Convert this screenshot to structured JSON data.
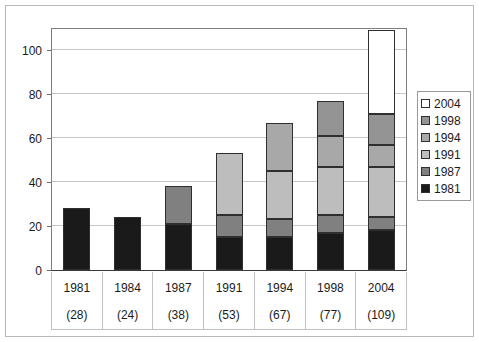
{
  "chart_data": {
    "type": "bar",
    "subtype": "stacked-bar",
    "title": "",
    "xlabel": "",
    "ylabel": "",
    "ylim": [
      0,
      110
    ],
    "yticks": [
      0,
      20,
      40,
      60,
      80,
      100
    ],
    "ytick_labels": [
      "0",
      "20",
      "40",
      "60",
      "80",
      "100"
    ],
    "grid": true,
    "grid_axis": "y",
    "legend_position": "right",
    "categories": [
      "1981",
      "1984",
      "1987",
      "1991",
      "1994",
      "1998",
      "2004"
    ],
    "category_totals": [
      28,
      24,
      38,
      53,
      67,
      77,
      109
    ],
    "category_total_labels": [
      "(28)",
      "(24)",
      "(38)",
      "(53)",
      "(67)",
      "(77)",
      "(109)"
    ],
    "series": [
      {
        "name": "1981",
        "color": "#1a1a1a",
        "values": [
          28,
          24,
          21,
          15,
          15,
          17,
          18
        ]
      },
      {
        "name": "1987",
        "color": "#808080",
        "values": [
          0,
          0,
          17,
          10,
          8,
          8,
          6
        ]
      },
      {
        "name": "1991",
        "color": "#bdbdbd",
        "values": [
          0,
          0,
          0,
          28,
          22,
          22,
          23
        ]
      },
      {
        "name": "1994",
        "color": "#a8a8a8",
        "values": [
          0,
          0,
          0,
          0,
          22,
          14,
          10
        ]
      },
      {
        "name": "1998",
        "color": "#949494",
        "values": [
          0,
          0,
          0,
          0,
          0,
          16,
          14
        ]
      },
      {
        "name": "2004",
        "color": "#ffffff",
        "values": [
          0,
          0,
          0,
          0,
          0,
          0,
          38
        ]
      }
    ],
    "stack_order_bottom_to_top": [
      "1981",
      "1987",
      "1991",
      "1994",
      "1998",
      "2004"
    ]
  },
  "legend": {
    "items": [
      {
        "label": "2004",
        "color": "#ffffff"
      },
      {
        "label": "1998",
        "color": "#949494"
      },
      {
        "label": "1994",
        "color": "#a8a8a8"
      },
      {
        "label": "1991",
        "color": "#bdbdbd"
      },
      {
        "label": "1987",
        "color": "#808080"
      },
      {
        "label": "1981",
        "color": "#1a1a1a"
      }
    ]
  },
  "axis": {
    "y_tick_labels": [
      "100",
      "80",
      "60",
      "40",
      "20",
      "0"
    ],
    "y_tick_values": [
      100,
      80,
      60,
      40,
      20,
      0
    ]
  },
  "xaxis_table": {
    "rows": [
      {
        "year": "1981",
        "total": "(28)"
      },
      {
        "year": "1984",
        "total": "(24)"
      },
      {
        "year": "1987",
        "total": "(38)"
      },
      {
        "year": "1991",
        "total": "(53)"
      },
      {
        "year": "1994",
        "total": "(67)"
      },
      {
        "year": "1998",
        "total": "(77)"
      },
      {
        "year": "2004",
        "total": "(109)"
      }
    ]
  },
  "colors": {
    "plot_border": "#7d7d7d",
    "axis_line": "#3a3a3a",
    "gridline": "#c8c8c8",
    "outer_frame": "#b9b9b9",
    "text": "#1b1b1b",
    "segment_border": "#2f2f2f"
  }
}
